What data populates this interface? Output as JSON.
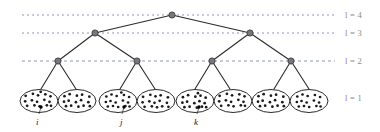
{
  "figure": {
    "type": "hierarchical-tree-diagram",
    "background_color": "#ffffff",
    "edge_color": "#2b2b2b",
    "node_color": "#777777",
    "node_stroke_color": "#3d3d3d",
    "dotted_line_color": "#6f7fa8",
    "ellipse_stroke_color": "#2b2b2b",
    "dot_color": "#1a1a1a",
    "label_color": "#8a8a8a"
  },
  "level_labels": [
    {
      "text": "l = 4",
      "x": 345,
      "y": 10
    },
    {
      "text": "l = 3",
      "x": 345,
      "y": 28
    },
    {
      "text": "l = 2",
      "x": 345,
      "y": 56
    },
    {
      "text": "l = 1",
      "x": 345,
      "y": 93
    }
  ],
  "level_lines": [
    {
      "level": 4,
      "y": 15,
      "x1": 22,
      "x2": 335,
      "dash": "2 3"
    },
    {
      "level": 3,
      "y": 33,
      "x1": 22,
      "x2": 335,
      "dash": "2 3"
    },
    {
      "level": 2,
      "y": 61,
      "x1": 22,
      "x2": 335,
      "dash": "3 3"
    }
  ],
  "nodes": {
    "level4": [
      {
        "id": "root",
        "x": 172,
        "y": 15,
        "r": 3.1
      }
    ],
    "level3": [
      {
        "id": "n3a",
        "x": 95,
        "y": 33,
        "r": 3.1
      },
      {
        "id": "n3b",
        "x": 250,
        "y": 33,
        "r": 3.1
      }
    ],
    "level2": [
      {
        "id": "n2a",
        "x": 58,
        "y": 61,
        "r": 3.1
      },
      {
        "id": "n2b",
        "x": 137,
        "y": 61,
        "r": 3.1
      },
      {
        "id": "n2c",
        "x": 212,
        "y": 61,
        "r": 3.1
      },
      {
        "id": "n2d",
        "x": 291,
        "y": 61,
        "r": 3.1
      }
    ]
  },
  "edges": [
    {
      "from": "root",
      "to": "n3a",
      "x1": 172,
      "y1": 15,
      "x2": 95,
      "y2": 33
    },
    {
      "from": "root",
      "to": "n3b",
      "x1": 172,
      "y1": 15,
      "x2": 250,
      "y2": 33
    },
    {
      "from": "n3a",
      "to": "n2a",
      "x1": 95,
      "y1": 33,
      "x2": 58,
      "y2": 61
    },
    {
      "from": "n3a",
      "to": "n2b",
      "x1": 95,
      "y1": 33,
      "x2": 137,
      "y2": 61
    },
    {
      "from": "n3b",
      "to": "n2c",
      "x1": 250,
      "y1": 33,
      "x2": 212,
      "y2": 61
    },
    {
      "from": "n3b",
      "to": "n2d",
      "x1": 250,
      "y1": 33,
      "x2": 291,
      "y2": 61
    },
    {
      "from": "n2a",
      "to": "leaf1",
      "x1": 58,
      "y1": 61,
      "x2": 41,
      "y2": 89
    },
    {
      "from": "n2a",
      "to": "leaf2",
      "x1": 58,
      "y1": 61,
      "x2": 76,
      "y2": 89
    },
    {
      "from": "n2b",
      "to": "leaf3",
      "x1": 137,
      "y1": 61,
      "x2": 120,
      "y2": 89
    },
    {
      "from": "n2b",
      "to": "leaf4",
      "x1": 137,
      "y1": 61,
      "x2": 155,
      "y2": 89
    },
    {
      "from": "n2c",
      "to": "leaf5",
      "x1": 212,
      "y1": 61,
      "x2": 195,
      "y2": 89
    },
    {
      "from": "n2c",
      "to": "leaf6",
      "x1": 212,
      "y1": 61,
      "x2": 230,
      "y2": 89
    },
    {
      "from": "n2d",
      "to": "leaf7",
      "x1": 291,
      "y1": 61,
      "x2": 274,
      "y2": 89
    },
    {
      "from": "n2d",
      "to": "leaf8",
      "x1": 291,
      "y1": 61,
      "x2": 309,
      "y2": 89
    }
  ],
  "leaves": [
    {
      "id": "leaf1",
      "cx": 39,
      "cy": 101,
      "rx": 19,
      "ry": 11.5,
      "dot_count": 16
    },
    {
      "id": "leaf2",
      "cx": 77,
      "cy": 101,
      "rx": 19,
      "ry": 11.5,
      "dot_count": 15
    },
    {
      "id": "leaf3",
      "cx": 118,
      "cy": 101,
      "rx": 19,
      "ry": 11.5,
      "dot_count": 16
    },
    {
      "id": "leaf4",
      "cx": 156,
      "cy": 101,
      "rx": 19,
      "ry": 11.5,
      "dot_count": 15
    },
    {
      "id": "leaf5",
      "cx": 195,
      "cy": 101,
      "rx": 19,
      "ry": 11.5,
      "dot_count": 16
    },
    {
      "id": "leaf6",
      "cx": 233,
      "cy": 101,
      "rx": 19,
      "ry": 11.5,
      "dot_count": 15
    },
    {
      "id": "leaf7",
      "cx": 271,
      "cy": 101,
      "rx": 19,
      "ry": 11.5,
      "dot_count": 15
    },
    {
      "id": "leaf8",
      "cx": 309,
      "cy": 101,
      "rx": 19,
      "ry": 11.5,
      "dot_count": 15
    }
  ],
  "node_labels": [
    {
      "text": "i",
      "x": 36,
      "y": 117,
      "pointer": {
        "x1": 39,
        "y1": 114,
        "x2": 41,
        "y2": 107
      },
      "marked_dot": {
        "cx": 41,
        "cy": 107
      }
    },
    {
      "text": "j",
      "x": 120,
      "y": 117,
      "pointer": {
        "x1": 122,
        "y1": 114,
        "x2": 124,
        "y2": 107
      },
      "marked_dot": {
        "cx": 124,
        "cy": 107
      }
    },
    {
      "text": "k",
      "x": 194,
      "y": 117,
      "pointer": {
        "x1": 197,
        "y1": 114,
        "x2": 199,
        "y2": 107
      },
      "marked_dot": {
        "cx": 199,
        "cy": 107
      }
    }
  ],
  "leaf_dot_offsets": [
    [
      -12.5,
      -4.5
    ],
    [
      -6.5,
      -6.5
    ],
    [
      -0.5,
      -5.0
    ],
    [
      5.5,
      -6.0
    ],
    [
      11.5,
      -4.0
    ],
    [
      -13.0,
      1.0
    ],
    [
      -7.5,
      0.0
    ],
    [
      -1.5,
      1.5
    ],
    [
      4.5,
      -0.5
    ],
    [
      10.5,
      1.5
    ],
    [
      -11.0,
      5.5
    ],
    [
      -5.0,
      5.0
    ],
    [
      1.0,
      6.0
    ],
    [
      7.0,
      5.0
    ],
    [
      12.0,
      5.5
    ],
    [
      2.5,
      -8.5
    ]
  ]
}
